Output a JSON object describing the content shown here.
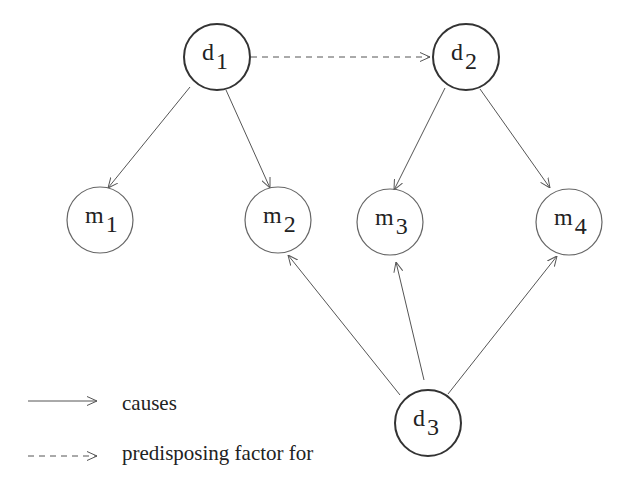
{
  "diagram": {
    "colors": {
      "stroke_disease": "#333333",
      "stroke_manifestation": "#666666",
      "edge": "#555555",
      "text": "#222222",
      "background": "#ffffff"
    },
    "nodes": [
      {
        "id": "d1",
        "base": "d",
        "sub": "1",
        "cx": 217,
        "cy": 57,
        "r": 33,
        "kind": "disease"
      },
      {
        "id": "d2",
        "base": "d",
        "sub": "2",
        "cx": 466,
        "cy": 57,
        "r": 33,
        "kind": "disease"
      },
      {
        "id": "d3",
        "base": "d",
        "sub": "3",
        "cx": 428,
        "cy": 423,
        "r": 33,
        "kind": "disease"
      },
      {
        "id": "m1",
        "base": "m",
        "sub": "1",
        "cx": 100,
        "cy": 220,
        "r": 33,
        "kind": "manifestation"
      },
      {
        "id": "m2",
        "base": "m",
        "sub": "2",
        "cx": 278,
        "cy": 220,
        "r": 33,
        "kind": "manifestation"
      },
      {
        "id": "m3",
        "base": "m",
        "sub": "3",
        "cx": 390,
        "cy": 222,
        "r": 33,
        "kind": "manifestation"
      },
      {
        "id": "m4",
        "base": "m",
        "sub": "4",
        "cx": 569,
        "cy": 222,
        "r": 33,
        "kind": "manifestation"
      }
    ],
    "edges": [
      {
        "from": "d1",
        "to": "d2",
        "type": "predisposing",
        "x1": 251,
        "y1": 57,
        "x2": 430,
        "y2": 57
      },
      {
        "from": "d1",
        "to": "m1",
        "type": "causes",
        "x1": 190,
        "y1": 87,
        "x2": 108,
        "y2": 188
      },
      {
        "from": "d1",
        "to": "m2",
        "type": "causes",
        "x1": 226,
        "y1": 90,
        "x2": 270,
        "y2": 188
      },
      {
        "from": "d2",
        "to": "m3",
        "type": "causes",
        "x1": 445,
        "y1": 88,
        "x2": 394,
        "y2": 190
      },
      {
        "from": "d2",
        "to": "m4",
        "type": "causes",
        "x1": 480,
        "y1": 89,
        "x2": 550,
        "y2": 188
      },
      {
        "from": "d3",
        "to": "m2",
        "type": "causes",
        "x1": 400,
        "y1": 395,
        "x2": 288,
        "y2": 255
      },
      {
        "from": "d3",
        "to": "m3",
        "type": "causes",
        "x1": 424,
        "y1": 380,
        "x2": 396,
        "y2": 262
      },
      {
        "from": "d3",
        "to": "m4",
        "type": "causes",
        "x1": 448,
        "y1": 394,
        "x2": 557,
        "y2": 256
      }
    ]
  },
  "legend": {
    "items": [
      {
        "type": "causes",
        "line_style": "solid",
        "label": "causes"
      },
      {
        "type": "predisposing",
        "line_style": "dashed",
        "label": "predisposing factor for"
      }
    ]
  }
}
